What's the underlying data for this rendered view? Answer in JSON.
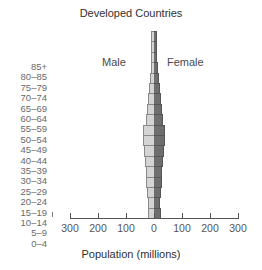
{
  "chart_data": {
    "type": "bar",
    "subtype": "population-pyramid",
    "title": "Developed Countries",
    "xlabel": "Population (millions)",
    "ylabel": "",
    "categories": [
      "85+",
      "80-85",
      "75-79",
      "70-74",
      "65-69",
      "60-64",
      "55-59",
      "50-54",
      "45-49",
      "40-44",
      "35-39",
      "30-34",
      "25-29",
      "20-24",
      "15-19",
      "10-14",
      "5-9",
      "0-4"
    ],
    "series": [
      {
        "name": "Male",
        "color": "#d4d4d4",
        "values": [
          3,
          6,
          8,
          11,
          15,
          18,
          22,
          26,
          30,
          38,
          40,
          36,
          32,
          30,
          27,
          24,
          22,
          22
        ]
      },
      {
        "name": "Female",
        "color": "#6e6e6e",
        "values": [
          6,
          9,
          12,
          15,
          18,
          21,
          24,
          27,
          31,
          38,
          40,
          36,
          32,
          30,
          27,
          24,
          23,
          24
        ]
      }
    ],
    "xlim": [
      -300,
      300
    ],
    "xticks": [
      -300,
      -200,
      -100,
      0,
      100,
      200,
      300
    ],
    "xtick_labels": [
      "300",
      "200",
      "100",
      "0",
      "100",
      "200",
      "300"
    ],
    "grid": false,
    "legend": "inline labels (Male left, Female right)"
  },
  "labels": {
    "title": "Developed Countries",
    "male": "Male",
    "female": "Female",
    "xlabel": "Population (millions)"
  }
}
